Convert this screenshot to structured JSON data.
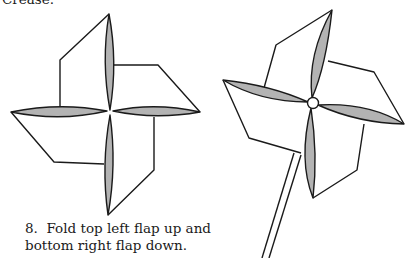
{
  "captions": {
    "previous_step_tail": "Crease.",
    "step": {
      "number": "8.",
      "line1": "Fold top left flap up and",
      "line2": "bottom right flap down."
    }
  },
  "figures": [
    {
      "name": "pinwheel-folded-flat",
      "description": "Flat paper pinwheel with four shaded blades, viewed from front"
    },
    {
      "name": "pinwheel-finished",
      "description": "Finished pinwheel mounted with a pin on a stick"
    }
  ],
  "colors": {
    "line": "#1a1a1a",
    "blade_fill": "#b3b3b3",
    "paper": "#ffffff"
  }
}
